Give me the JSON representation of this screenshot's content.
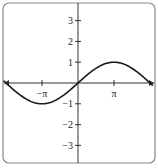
{
  "chart_data": {
    "type": "line",
    "title": "",
    "function": "y = sin(x/2)",
    "xlabel": "",
    "ylabel": "",
    "xlim": [
      -6.28,
      6.28
    ],
    "ylim": [
      -3.5,
      3.5
    ],
    "x_ticks": [
      {
        "value": -3.14159,
        "label": "−π"
      },
      {
        "value": 3.14159,
        "label": "π"
      }
    ],
    "y_ticks": [
      {
        "value": 3,
        "label": "3"
      },
      {
        "value": 2,
        "label": "2"
      },
      {
        "value": 1,
        "label": "1"
      },
      {
        "value": -1,
        "label": "−1"
      },
      {
        "value": -2,
        "label": "−2"
      },
      {
        "value": -3,
        "label": "−3"
      }
    ],
    "series": [
      {
        "name": "sin(x/2)",
        "x": [
          -6.283,
          -4.712,
          -3.142,
          -1.571,
          0,
          1.571,
          3.142,
          4.712,
          6.283
        ],
        "y": [
          0,
          -0.707,
          -1,
          -0.707,
          0,
          0.707,
          1,
          0.707,
          0
        ]
      }
    ],
    "grid": false,
    "legend": null,
    "frame": "rounded-rectangle",
    "x_axis_arrows": true
  },
  "colors": {
    "curve": "#1a1a1a",
    "axes": "#333333",
    "frame": "#888888"
  }
}
